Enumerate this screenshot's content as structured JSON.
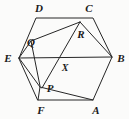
{
  "figure": {
    "kind": "geometry-diagram",
    "canvas": {
      "width": 129,
      "height": 119
    },
    "background_color": "#fbfbfa",
    "stroke_color": "#262626",
    "label_color": "#1a1a1a",
    "outer_polygon": {
      "name": "hexagon-ABCDEF",
      "points": "19,58 36,18 93,18 112,57 93,100 38,100",
      "closed": true
    },
    "segments": [
      {
        "name": "segment-E-B",
        "x1": 19,
        "y1": 58,
        "x2": 112,
        "y2": 57
      },
      {
        "name": "segment-Q-R",
        "x1": 31,
        "y1": 41,
        "x2": 80,
        "y2": 22
      },
      {
        "name": "segment-R-B",
        "x1": 80,
        "y1": 22,
        "x2": 112,
        "y2": 57
      },
      {
        "name": "segment-R-P",
        "x1": 80,
        "y1": 22,
        "x2": 42,
        "y2": 88
      },
      {
        "name": "segment-Q-P",
        "x1": 31,
        "y1": 41,
        "x2": 40,
        "y2": 86
      },
      {
        "name": "segment-E-Q",
        "x1": 19,
        "y1": 58,
        "x2": 31,
        "y2": 41
      },
      {
        "name": "segment-E-P",
        "x1": 19,
        "y1": 58,
        "x2": 40,
        "y2": 87
      },
      {
        "name": "segment-P-A",
        "x1": 40,
        "y1": 87,
        "x2": 93,
        "y2": 100
      },
      {
        "name": "segment-P-F",
        "x1": 40,
        "y1": 87,
        "x2": 38,
        "y2": 100
      }
    ],
    "vertices": [
      {
        "id": "A",
        "label": "A",
        "px": 93,
        "py": 100,
        "label_x": 96,
        "label_y": 110
      },
      {
        "id": "B",
        "label": "B",
        "px": 112,
        "py": 57,
        "label_x": 121,
        "label_y": 58
      },
      {
        "id": "C",
        "label": "C",
        "px": 93,
        "py": 18,
        "label_x": 89,
        "label_y": 8
      },
      {
        "id": "D",
        "label": "D",
        "px": 36,
        "py": 18,
        "label_x": 39,
        "label_y": 8
      },
      {
        "id": "E",
        "label": "E",
        "px": 19,
        "py": 58,
        "label_x": 8,
        "label_y": 58
      },
      {
        "id": "F",
        "label": "F",
        "px": 38,
        "py": 100,
        "label_x": 41,
        "label_y": 110
      }
    ],
    "interior_points": [
      {
        "id": "P",
        "label": "P",
        "px": 41,
        "py": 87,
        "label_x": 50,
        "label_y": 88
      },
      {
        "id": "Q",
        "label": "Q",
        "px": 31,
        "py": 41,
        "label_x": 31,
        "label_y": 42
      },
      {
        "id": "R",
        "label": "R",
        "px": 80,
        "py": 22,
        "label_x": 81,
        "label_y": 34
      },
      {
        "id": "X",
        "label": "X",
        "px": 64,
        "py": 58,
        "label_x": 65,
        "label_y": 68
      }
    ]
  }
}
